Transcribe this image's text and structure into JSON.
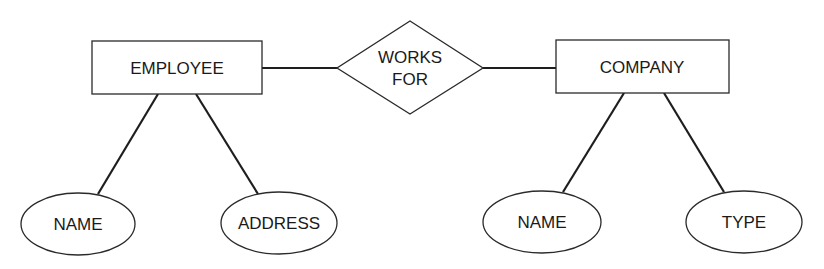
{
  "diagram": {
    "type": "entity-relationship",
    "entities": [
      {
        "id": "employee",
        "label": "EMPLOYEE"
      },
      {
        "id": "company",
        "label": "COMPANY"
      }
    ],
    "relationships": [
      {
        "id": "works_for",
        "label_line1": "WORKS",
        "label_line2": "FOR",
        "connects": [
          "employee",
          "company"
        ]
      }
    ],
    "attributes": [
      {
        "id": "employee_name",
        "label": "NAME",
        "entity": "employee"
      },
      {
        "id": "employee_address",
        "label": "ADDRESS",
        "entity": "employee"
      },
      {
        "id": "company_name",
        "label": "NAME",
        "entity": "company"
      },
      {
        "id": "company_type",
        "label": "TYPE",
        "entity": "company"
      }
    ],
    "colors": {
      "stroke": "#2a2a2a",
      "background": "#ffffff",
      "text": "#1a1a1a"
    }
  }
}
